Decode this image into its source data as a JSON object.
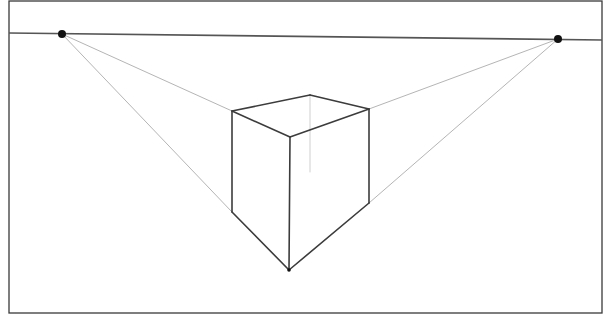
{
  "diagram": {
    "frame": {
      "x1": 9,
      "y1": 1,
      "x2": 602,
      "y2": 313,
      "color": "#3a3a3a"
    },
    "horizon": {
      "x1": 9,
      "y1": 33,
      "x2": 602,
      "y2": 40,
      "color": "#555555"
    },
    "vanishing_points": [
      {
        "id": "vp-left",
        "x": 62,
        "y": 34
      },
      {
        "id": "vp-right",
        "x": 558,
        "y": 39
      }
    ],
    "cube": {
      "top_left": [
        232,
        111
      ],
      "top_back": [
        310,
        95
      ],
      "top_right": [
        369,
        109
      ],
      "top_front": [
        290,
        137
      ],
      "bottom_left": [
        232,
        212
      ],
      "bottom_right": [
        369,
        203
      ],
      "bottom_front": [
        289,
        270
      ],
      "hidden_vertical_bottom": [
        310,
        172
      ]
    },
    "colors": {
      "edge": "#3c3c3c",
      "guide": "#b5b5b5",
      "point": "#111111"
    }
  }
}
